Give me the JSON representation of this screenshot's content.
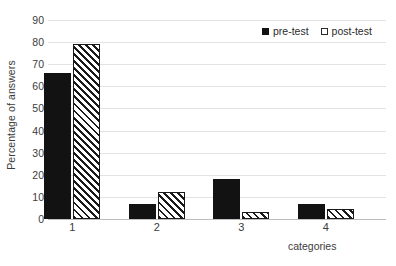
{
  "chart_data": {
    "type": "bar",
    "title": "",
    "subtitle": "",
    "xlabel": "categories",
    "ylabel": "Percentage of answers",
    "categories": [
      "1",
      "2",
      "3",
      "4"
    ],
    "series": [
      {
        "name": "pre-test",
        "values": [
          66,
          7,
          18,
          7
        ]
      },
      {
        "name": "post-test",
        "values": [
          79,
          12,
          3,
          4.5
        ]
      }
    ],
    "ylim": [
      0,
      90
    ],
    "ytick_step": 10,
    "yticks": [
      "90",
      "80",
      "70",
      "60",
      "50",
      "40",
      "30",
      "20",
      "10",
      "0"
    ],
    "grid": true,
    "grid_axis": "y",
    "legend_position": "top-right",
    "colors": {
      "pre_test_fill": "#121212",
      "post_test_fill": "#ffffff",
      "post_test_hatch": "#1a1a1a",
      "gridline": "#e3e3e3",
      "baseline": "#bdbdbd",
      "text": "#3b3b3b",
      "background": "#ffffff"
    }
  },
  "legend": {
    "entries": [
      {
        "label": "pre-test",
        "swatch": "filled-square-icon"
      },
      {
        "label": "post-test",
        "swatch": "outline-square-icon"
      }
    ]
  }
}
